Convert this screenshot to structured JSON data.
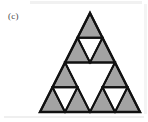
{
  "figure": {
    "panel_label": "(c)",
    "caption_text": "",
    "colors": {
      "fill_gray": "#a3a3a3",
      "stroke_black": "#111111",
      "background_white": "#ffffff",
      "label_ink": "#4a4a4a"
    },
    "geometry": {
      "apex": [
        90,
        13
      ],
      "bottom_left": [
        40,
        112
      ],
      "bottom_right": [
        140,
        112
      ],
      "stroke_width_outer": 2.4,
      "stroke_width_inner": 1.9
    },
    "shapes": {
      "filled_triangles": [
        {
          "name": "top-apex",
          "points": "90,13 102.5,37.75 77.5,37.75"
        },
        {
          "name": "top-left",
          "points": "77.5,37.75 90,62.5 65,62.5"
        },
        {
          "name": "top-right",
          "points": "102.5,37.75 115,62.5 90,62.5"
        },
        {
          "name": "left-apex",
          "points": "65,62.5 77.5,87.25 52.5,87.25"
        },
        {
          "name": "left-left",
          "points": "52.5,87.25 65,112 40,112"
        },
        {
          "name": "left-right",
          "points": "77.5,87.25 90,112 65,112"
        },
        {
          "name": "right-apex",
          "points": "115,62.5 127.5,87.25 102.5,87.25"
        },
        {
          "name": "right-left",
          "points": "102.5,87.25 115,112 90,112"
        },
        {
          "name": "right-right",
          "points": "127.5,87.25 140,112 115,112"
        }
      ],
      "hole_triangles": [
        {
          "name": "center-large-hole",
          "points": "65,62.5 115,62.5 90,112"
        },
        {
          "name": "top-small-hole",
          "points": "77.5,37.75 102.5,37.75 90,62.5"
        },
        {
          "name": "left-small-hole",
          "points": "52.5,87.25 77.5,87.25 65,112"
        },
        {
          "name": "right-small-hole",
          "points": "102.5,87.25 127.5,87.25 115,112"
        }
      ]
    }
  }
}
